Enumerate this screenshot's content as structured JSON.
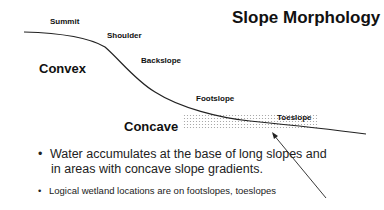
{
  "title": "Slope Morphology",
  "labels": {
    "summit": "Summit",
    "shoulder": "Shoulder",
    "backslope": "Backslope",
    "footslope": "Footslope",
    "toeslope": "Toeslope",
    "convex": "Convex",
    "concave": "Concave"
  },
  "bullets": [
    {
      "marker": "•",
      "line1": "Water accumulates at the base of long slopes and",
      "line2": "in areas with concave slope gradients."
    },
    {
      "marker": "•",
      "line1": "Logical wetland locations are on footslopes, toeslopes"
    }
  ],
  "colors": {
    "line": "#222222",
    "dots": "#9a9a9a"
  }
}
